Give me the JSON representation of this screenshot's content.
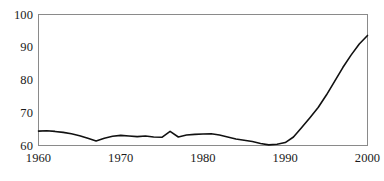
{
  "chart_data": {
    "type": "line",
    "title": "",
    "subtitle": "",
    "xlabel": "",
    "ylabel": "",
    "xlim": [
      1960,
      2000
    ],
    "ylim": [
      60,
      100
    ],
    "xticks": [
      1960,
      1970,
      1980,
      1990,
      2000
    ],
    "yticks": [
      60,
      70,
      80,
      90,
      100
    ],
    "xtick_labels": [
      "1960",
      "1970",
      "1980",
      "1990",
      "2000"
    ],
    "ytick_labels": [
      "60",
      "70",
      "80",
      "90",
      "100"
    ],
    "grid": false,
    "legend": null,
    "legend_position": "none",
    "line_color": "#111111",
    "line_width": 1.6,
    "frame_color": "#8a8a8a",
    "background_color": "#ffffff",
    "series": [
      {
        "name": "value",
        "x": [
          1960,
          1961,
          1962,
          1963,
          1964,
          1965,
          1966,
          1967,
          1968,
          1969,
          1970,
          1971,
          1972,
          1973,
          1974,
          1975,
          1976,
          1977,
          1978,
          1979,
          1980,
          1981,
          1982,
          1983,
          1984,
          1985,
          1986,
          1987,
          1988,
          1989,
          1990,
          1991,
          1992,
          1993,
          1994,
          1995,
          1996,
          1997,
          1998,
          1999,
          2000
        ],
        "values": [
          64.4,
          64.5,
          64.3,
          64.0,
          63.6,
          63.0,
          62.2,
          61.4,
          62.2,
          62.8,
          63.1,
          62.9,
          62.7,
          62.9,
          62.6,
          62.5,
          64.3,
          62.6,
          63.2,
          63.4,
          63.5,
          63.6,
          63.2,
          62.6,
          62.0,
          61.6,
          61.2,
          60.6,
          60.2,
          60.4,
          60.9,
          62.6,
          65.5,
          68.5,
          71.6,
          75.4,
          79.6,
          83.8,
          87.6,
          91.0,
          93.6
        ]
      }
    ]
  },
  "axes": {
    "y_labels": [
      {
        "text": "100",
        "value": 100
      },
      {
        "text": "90",
        "value": 90
      },
      {
        "text": "80",
        "value": 80
      },
      {
        "text": "70",
        "value": 70
      },
      {
        "text": "60",
        "value": 60
      }
    ],
    "x_labels": [
      {
        "text": "1960",
        "value": 1960
      },
      {
        "text": "1970",
        "value": 1970
      },
      {
        "text": "1980",
        "value": 1980
      },
      {
        "text": "1990",
        "value": 1990
      },
      {
        "text": "2000",
        "value": 2000
      }
    ]
  }
}
